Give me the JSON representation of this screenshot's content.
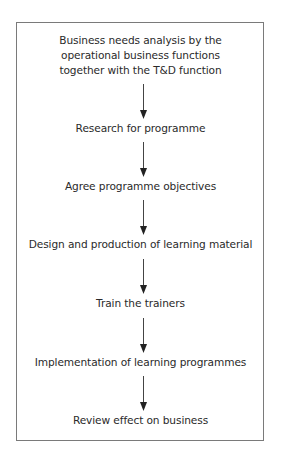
{
  "diagram": {
    "type": "flowchart",
    "direction": "top-to-bottom",
    "steps": [
      {
        "label_lines": [
          "Business needs analysis by the",
          "operational business functions",
          "together with the T&D function"
        ]
      },
      {
        "label": "Research for programme"
      },
      {
        "label": "Agree programme objectives"
      },
      {
        "label": "Design and production of learning material"
      },
      {
        "label": "Train the trainers"
      },
      {
        "label": "Implementation of learning programmes"
      },
      {
        "label": "Review effect on business"
      }
    ],
    "connectors": [
      {
        "from": 0,
        "to": 1,
        "icon": "arrow-down-icon"
      },
      {
        "from": 1,
        "to": 2,
        "icon": "arrow-down-icon"
      },
      {
        "from": 2,
        "to": 3,
        "icon": "arrow-down-icon"
      },
      {
        "from": 3,
        "to": 4,
        "icon": "arrow-down-icon"
      },
      {
        "from": 4,
        "to": 5,
        "icon": "arrow-down-icon"
      },
      {
        "from": 5,
        "to": 6,
        "icon": "arrow-down-icon"
      }
    ],
    "colors": {
      "text": "#2a2a2a",
      "border": "#7a7a7a",
      "arrow": "#222222",
      "background": "#ffffff"
    }
  }
}
